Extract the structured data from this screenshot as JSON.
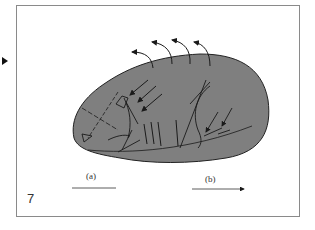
{
  "figure": {
    "number": "7",
    "labels": {
      "a": "(a)",
      "b": "(b)"
    },
    "colors": {
      "blob_fill": "#7f7f7f",
      "blob_stroke": "#222222",
      "line": "#1a1a1a",
      "frame": "#8a8a8a",
      "background": "#ffffff"
    },
    "icons": {
      "marker": "right-triangle-marker",
      "arrow_b": "right-arrow"
    }
  }
}
